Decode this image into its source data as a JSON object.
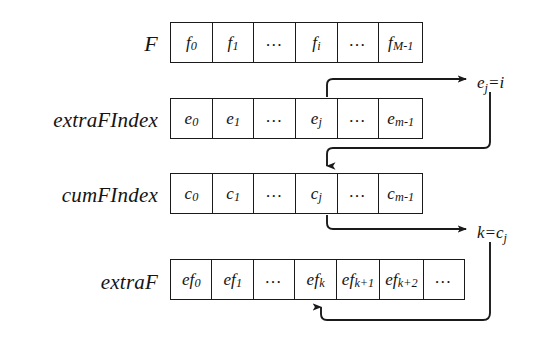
{
  "diagram": {
    "background_color": "#ffffff",
    "stroke_color": "#1a1a1a",
    "rows": [
      {
        "label": "F",
        "name": "array-F",
        "cells": [
          {
            "base": "f",
            "sub": "0"
          },
          {
            "base": "f",
            "sub": "1"
          },
          {
            "base": "...",
            "sub": ""
          },
          {
            "base": "f",
            "sub": "i"
          },
          {
            "base": "...",
            "sub": ""
          },
          {
            "base": "f",
            "sub": "M-1"
          }
        ]
      },
      {
        "label": "extraFIndex",
        "name": "array-extraFIndex",
        "cells": [
          {
            "base": "e",
            "sub": "0"
          },
          {
            "base": "e",
            "sub": "1"
          },
          {
            "base": "...",
            "sub": ""
          },
          {
            "base": "e",
            "sub": "j"
          },
          {
            "base": "...",
            "sub": ""
          },
          {
            "base": "e",
            "sub": "m-1"
          }
        ]
      },
      {
        "label": "cumFIndex",
        "name": "array-cumFIndex",
        "cells": [
          {
            "base": "c",
            "sub": "0"
          },
          {
            "base": "c",
            "sub": "1"
          },
          {
            "base": "...",
            "sub": ""
          },
          {
            "base": "c",
            "sub": "j"
          },
          {
            "base": "...",
            "sub": ""
          },
          {
            "base": "c",
            "sub": "m-1"
          }
        ]
      },
      {
        "label": "extraF",
        "name": "array-extraF",
        "cells": [
          {
            "base": "ef",
            "sub": "0"
          },
          {
            "base": "ef",
            "sub": "1"
          },
          {
            "base": "...",
            "sub": ""
          },
          {
            "base": "ef",
            "sub": "k"
          },
          {
            "base": "ef",
            "sub": "k+1"
          },
          {
            "base": "ef",
            "sub": "k+2"
          },
          {
            "base": "...",
            "sub": ""
          }
        ]
      }
    ],
    "annotations": [
      {
        "name": "annotation-ej-equals-i",
        "base": "e",
        "sub": "j",
        "tail": "=i"
      },
      {
        "name": "annotation-k-equals-cj",
        "base": "k=c",
        "sub": "j",
        "tail": ""
      }
    ],
    "connectors": [
      {
        "name": "connector-ej-to-label",
        "from": "extraFIndex cell e_j (top edge)",
        "to": "label e_j=i"
      },
      {
        "name": "connector-label-to-cj",
        "from": "label e_j=i (below)",
        "to": "cumFIndex cell c_j (top edge)"
      },
      {
        "name": "connector-cj-to-label",
        "from": "cumFIndex cell c_j (bottom edge)",
        "to": "label k=c_j"
      },
      {
        "name": "connector-label-to-efk",
        "from": "label k=c_j (below)",
        "to": "extraF cell ef_k (bottom edge)"
      }
    ]
  }
}
